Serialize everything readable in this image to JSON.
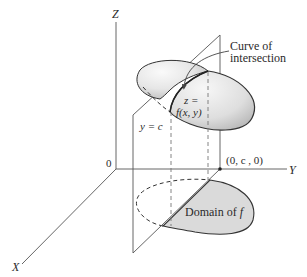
{
  "diagram": {
    "axes": {
      "z_label": "Z",
      "y_label": "Y",
      "x_label": "X",
      "origin_label": "0"
    },
    "labels": {
      "curve_line1": "Curve of",
      "curve_line2": "intersection",
      "surface_line1": "z =",
      "surface_line2": "f(x, y)",
      "plane": "y = c",
      "point": "(0, c , 0)",
      "domain": "Domain of",
      "domain_f": "f"
    },
    "colors": {
      "line": "#555555",
      "surface_fill_light": "#f4f4f4",
      "surface_fill_dark": "#bdbdbd",
      "domain_fill": "#dadada",
      "text": "#2a2a2a"
    }
  }
}
